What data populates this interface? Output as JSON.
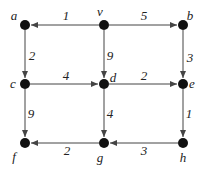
{
  "diagram": {
    "type": "weighted-directed-graph",
    "nodes": [
      {
        "id": "a",
        "label": "a",
        "x": 25,
        "y": 25,
        "lx": 14,
        "ly": 20
      },
      {
        "id": "v",
        "label": "v",
        "x": 104,
        "y": 25,
        "lx": 100,
        "ly": 16
      },
      {
        "id": "b",
        "label": "b",
        "x": 183,
        "y": 25,
        "lx": 190,
        "ly": 20
      },
      {
        "id": "c",
        "label": "c",
        "x": 25,
        "y": 84,
        "lx": 13,
        "ly": 88
      },
      {
        "id": "d",
        "label": "d",
        "x": 104,
        "y": 84,
        "lx": 113,
        "ly": 82
      },
      {
        "id": "e",
        "label": "e",
        "x": 183,
        "y": 84,
        "lx": 192,
        "ly": 88
      },
      {
        "id": "f",
        "label": "f",
        "x": 25,
        "y": 143,
        "lx": 14,
        "ly": 161
      },
      {
        "id": "g",
        "label": "g",
        "x": 104,
        "y": 143,
        "lx": 100,
        "ly": 162
      },
      {
        "id": "h",
        "label": "h",
        "x": 183,
        "y": 143,
        "lx": 183,
        "ly": 162
      }
    ],
    "edges": [
      {
        "from": "v",
        "to": "a",
        "weight": "1",
        "wx": 66,
        "wy": 20
      },
      {
        "from": "v",
        "to": "b",
        "weight": "5",
        "wx": 144,
        "wy": 20
      },
      {
        "from": "a",
        "to": "c",
        "weight": "2",
        "wx": 32,
        "wy": 60
      },
      {
        "from": "v",
        "to": "d",
        "weight": "9",
        "wx": 110,
        "wy": 60
      },
      {
        "from": "b",
        "to": "e",
        "weight": "3",
        "wx": 190,
        "wy": 62
      },
      {
        "from": "c",
        "to": "d",
        "weight": "4",
        "wx": 66,
        "wy": 80
      },
      {
        "from": "d",
        "to": "e",
        "weight": "2",
        "wx": 144,
        "wy": 80
      },
      {
        "from": "c",
        "to": "f",
        "weight": "9",
        "wx": 31,
        "wy": 118
      },
      {
        "from": "d",
        "to": "g",
        "weight": "4",
        "wx": 110,
        "wy": 118
      },
      {
        "from": "e",
        "to": "h",
        "weight": "1",
        "wx": 189,
        "wy": 118
      },
      {
        "from": "g",
        "to": "f",
        "weight": "2",
        "wx": 67,
        "wy": 155
      },
      {
        "from": "h",
        "to": "g",
        "weight": "3",
        "wx": 144,
        "wy": 155
      }
    ],
    "colors": {
      "node": "#111111",
      "edge": "#444444",
      "text": "#222222"
    }
  }
}
